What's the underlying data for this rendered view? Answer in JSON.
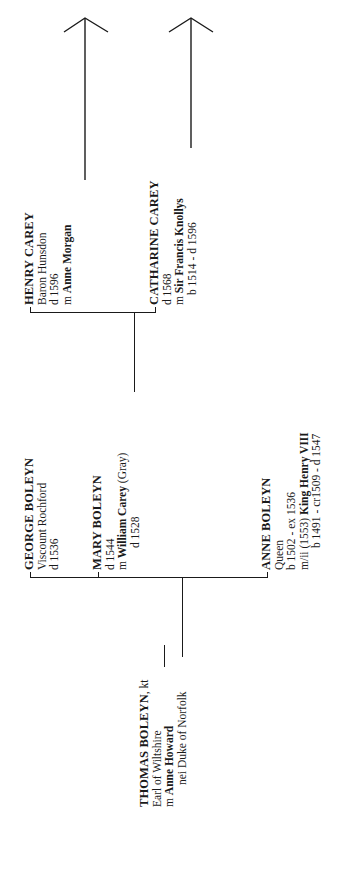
{
  "diagram": {
    "type": "family-tree",
    "orientation": "rotated-90-ccw",
    "root": {
      "name": "THOMAS BOLEYN",
      "name_suffix": ", kt",
      "title": "Earl of Wiltshire",
      "spouse_prefix": "m",
      "spouse": "Anne Howard",
      "spouse_note": "nei Duke of Norfolk"
    },
    "children": [
      {
        "name": "GEORGE BOLEYN",
        "title": "Viscount Rochford",
        "dates": "d 1536"
      },
      {
        "name": "MARY BOLEYN",
        "dates": "d 1544",
        "spouse_prefix": "m",
        "spouse": "William Carey",
        "spouse_suffix": " (Gray)",
        "spouse_dates": "d 1528"
      },
      {
        "name": "ANNE BOLEYN",
        "title": "Queen",
        "dates": "b 1502 - ex 1536",
        "spouse_prefix": "m/ii (1553)",
        "spouse": "King Henry VIII",
        "spouse_dates": "b 1491 - cr1509 - d 1547"
      }
    ],
    "grandchildren": [
      {
        "name": "HENRY CAREY",
        "title": "Baron Hunsdon",
        "dates": "d 1596",
        "spouse_prefix": "m",
        "spouse": "Anne Morgan"
      },
      {
        "name": "CATHARINE CAREY",
        "dates": "d 1568",
        "spouse_prefix": "m",
        "spouse": "Sir Francis Knollys",
        "spouse_dates": "b 1514 - d 1596"
      }
    ]
  }
}
